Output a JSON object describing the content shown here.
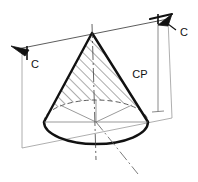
{
  "figure": {
    "background_color": "#ffffff",
    "line_color": "#1a1a1a",
    "thin_line_color": "#8a8a8a",
    "hatch_color": "#2b2b2b",
    "width": 198,
    "height": 182
  },
  "labels": {
    "cut_left": "C",
    "cut_right": "C",
    "cutting_plane": "CP"
  },
  "geometry": {
    "apex": {
      "x": 92,
      "y": 33
    },
    "base_center": {
      "x": 96,
      "y": 122
    },
    "base_rx": 52,
    "base_ry": 22,
    "cut_line_start": {
      "x": 20,
      "y": 48
    },
    "cut_line_end": {
      "x": 168,
      "y": 19
    },
    "left_extension_x": 22,
    "right_extension_x": 158,
    "extension_bottom_y": 148,
    "cp_dim_top_y": 20,
    "cp_dim_bottom_y": 110,
    "axis_dashdot_angle_deg": 62
  },
  "elements": {
    "arrow_left_name": "section-arrow-left",
    "arrow_right_name": "section-arrow-right",
    "hatch_name": "section-hatching",
    "cone_outline_name": "cone-outline",
    "base_ellipse_name": "cone-base-ellipse",
    "centerline_name": "cone-centerline"
  }
}
